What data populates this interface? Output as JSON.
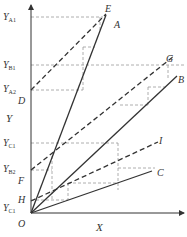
{
  "diagram": {
    "axes": {
      "x_label": "X",
      "y_label": "Y",
      "origin_label": "O"
    },
    "y_levels": [
      {
        "main": "Y",
        "sub": "A1"
      },
      {
        "main": "Y",
        "sub": "B1"
      },
      {
        "main": "Y",
        "sub": "A2"
      },
      {
        "main": "Y",
        "sub": "C1"
      },
      {
        "main": "Y",
        "sub": "B2"
      },
      {
        "main": "Y",
        "sub": "C1"
      }
    ],
    "intercept_labels": {
      "D": "D",
      "F": "F",
      "H": "H"
    },
    "solid_lines": {
      "A": "A",
      "B": "B",
      "C": "C"
    },
    "dashed_lines": {
      "E": "E",
      "G": "G",
      "I": "I"
    },
    "colors": {
      "line": "#333333",
      "dashed_grid": "#999999",
      "background": "#ffffff"
    }
  }
}
